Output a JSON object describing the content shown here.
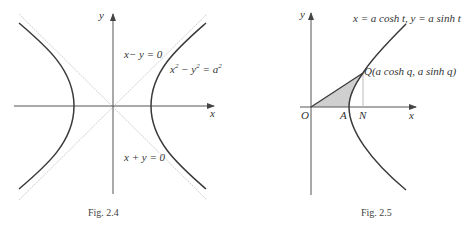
{
  "figures": [
    {
      "id": "fig-2-4",
      "caption": "Fig. 2.4",
      "axes": {
        "x_label": "x",
        "y_label": "y"
      },
      "asymptotes": [
        {
          "label": "x− y = 0"
        },
        {
          "label": "x + y = 0"
        }
      ],
      "curve": {
        "label_base": "x",
        "label_mid": " − y",
        "label_end": " = a",
        "exp": "2"
      }
    },
    {
      "id": "fig-2-5",
      "caption": "Fig. 2.5",
      "axes": {
        "x_label": "x",
        "y_label": "y"
      },
      "param_label": "x = a cosh t, y = a sinh t",
      "points": {
        "O": "O",
        "A": "A",
        "N": "N",
        "Q": "Q(a cosh q, a sinh q)"
      }
    }
  ],
  "colors": {
    "curve": "#3a3a3a",
    "axis": "#555555",
    "asymptote": "#c8c8c8",
    "shade": "#cfcfcf"
  }
}
